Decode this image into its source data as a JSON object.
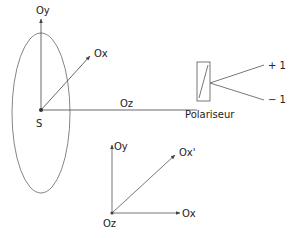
{
  "top_diagram": {
    "source_label": "S",
    "axis_y_label": "Oy",
    "axis_x_label": "Ox",
    "axis_z_label": "Oz",
    "polarizer_label": "Polariseur",
    "output_plus_label": "+ 1",
    "output_minus_label": "− 1"
  },
  "bottom_diagram": {
    "axis_y_label": "Oy",
    "axis_x_prime_label": "Ox'",
    "axis_x_label": "Ox",
    "origin_label": "Oz"
  },
  "colors": {
    "stroke": "#555555",
    "text": "#222222",
    "background": "#ffffff"
  }
}
